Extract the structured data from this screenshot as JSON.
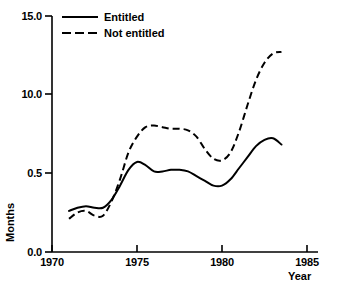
{
  "chart_data": {
    "type": "line",
    "title": "",
    "xlabel": "Year",
    "ylabel": "Months",
    "grid": false,
    "legend_position": "top-left",
    "xlim": [
      1970,
      1985
    ],
    "ylim_labels": [
      "0.0",
      "0.5",
      "10.0",
      "15.0"
    ],
    "xticks": [
      1970,
      1975,
      1980,
      1985
    ],
    "xtick_labels": [
      "1970",
      "1975",
      "1980",
      "1985"
    ],
    "yticks_display": [
      {
        "label": "0.0",
        "value": 0.0
      },
      {
        "label": "0.5",
        "value": 5.0
      },
      {
        "label": "10.0",
        "value": 10.0
      },
      {
        "label": "15.0",
        "value": 15.0
      }
    ],
    "series": [
      {
        "name": "Entitled",
        "style": "solid",
        "x": [
          1971.0,
          1971.5,
          1972.0,
          1972.5,
          1973.0,
          1973.5,
          1974.0,
          1974.5,
          1975.0,
          1975.5,
          1976.0,
          1976.5,
          1977.0,
          1977.5,
          1978.0,
          1978.5,
          1979.0,
          1979.5,
          1980.0,
          1980.5,
          1981.0,
          1981.5,
          1982.0,
          1982.5,
          1983.0,
          1983.5
        ],
        "y": [
          2.6,
          2.8,
          2.9,
          2.8,
          2.8,
          3.3,
          4.2,
          5.2,
          5.7,
          5.5,
          5.1,
          5.1,
          5.2,
          5.2,
          5.1,
          4.8,
          4.5,
          4.2,
          4.2,
          4.6,
          5.3,
          6.0,
          6.7,
          7.1,
          7.2,
          6.8
        ]
      },
      {
        "name": "Not entitled",
        "style": "dashed",
        "x": [
          1971.0,
          1971.5,
          1972.0,
          1972.5,
          1973.0,
          1973.5,
          1974.0,
          1974.5,
          1975.0,
          1975.5,
          1976.0,
          1976.5,
          1977.0,
          1977.5,
          1978.0,
          1978.5,
          1979.0,
          1979.5,
          1980.0,
          1980.5,
          1981.0,
          1981.5,
          1982.0,
          1982.5,
          1983.0,
          1983.5
        ],
        "y": [
          2.1,
          2.5,
          2.6,
          2.3,
          2.3,
          3.2,
          4.6,
          6.3,
          7.3,
          7.9,
          8.0,
          7.9,
          7.8,
          7.8,
          7.7,
          7.3,
          6.5,
          5.9,
          5.8,
          6.3,
          7.6,
          9.3,
          10.9,
          12.0,
          12.6,
          12.7
        ]
      }
    ]
  },
  "legend": {
    "entries": [
      {
        "label": "Entitled",
        "style": "solid"
      },
      {
        "label": "Not entitled",
        "style": "dashed"
      }
    ]
  },
  "axes": {
    "y_title": "Months",
    "x_title": "Year",
    "y_tick_labels": [
      "15.0",
      "10.0",
      "0.5",
      "0.0"
    ],
    "x_tick_labels": [
      "1970",
      "1975",
      "1980",
      "1985"
    ]
  }
}
